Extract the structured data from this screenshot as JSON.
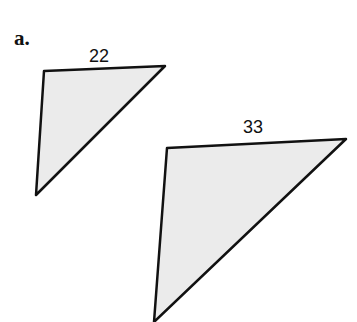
{
  "part_label": "a.",
  "triangles": [
    {
      "name": "small",
      "side_label": "22",
      "points": "44,71 165,66 36,195"
    },
    {
      "name": "large",
      "side_label": "33",
      "points": "167,148 346,139 154,322"
    }
  ],
  "colors": {
    "fill": "#ebebeb",
    "stroke": "#111111"
  }
}
